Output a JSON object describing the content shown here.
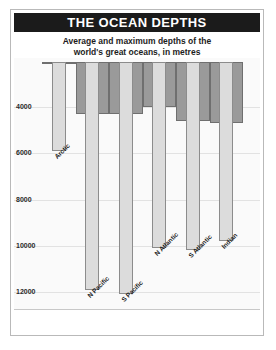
{
  "header": {
    "title": "THE OCEAN DEPTHS",
    "subtitle_line1": "Average and maximum depths of the",
    "subtitle_line2": "world's great oceans, in metres",
    "title_bg": "#1b1b1b",
    "title_fg": "#ffffff"
  },
  "colors": {
    "average_bar": "#9a9a9a",
    "average_bar_border": "#6f6f6f",
    "maximum_bar": "#dcdcdc",
    "maximum_bar_border": "#8c8c8c",
    "plot_background": "#fafafa",
    "gridline": "#e2e2e2",
    "frame": "#b9b9b9"
  },
  "chart_data": {
    "type": "bar",
    "title": "THE OCEAN DEPTHS",
    "subtitle": "Average and maximum depths of the world's great oceans, in metres",
    "xlabel": "",
    "ylabel": "",
    "ylim": [
      0,
      12300
    ],
    "y_inverted": true,
    "grid": true,
    "legend": "none",
    "yticks": [
      4000,
      6000,
      8000,
      10000,
      12000
    ],
    "ytick_labels": [
      "4000",
      "6000",
      "8000",
      "10000",
      "12000"
    ],
    "categories": [
      "Arctic",
      "N Pacific",
      "S Pacific",
      "N Atlantic",
      "S Atlantic",
      "Indian"
    ],
    "series": [
      {
        "name": "Average depth",
        "values": [
          1200,
          4300,
          4300,
          4000,
          4600,
          4700
        ]
      },
      {
        "name": "Maximum depth",
        "values": [
          5900,
          11900,
          12100,
          10100,
          10200,
          9800
        ]
      }
    ],
    "units": "metres"
  }
}
